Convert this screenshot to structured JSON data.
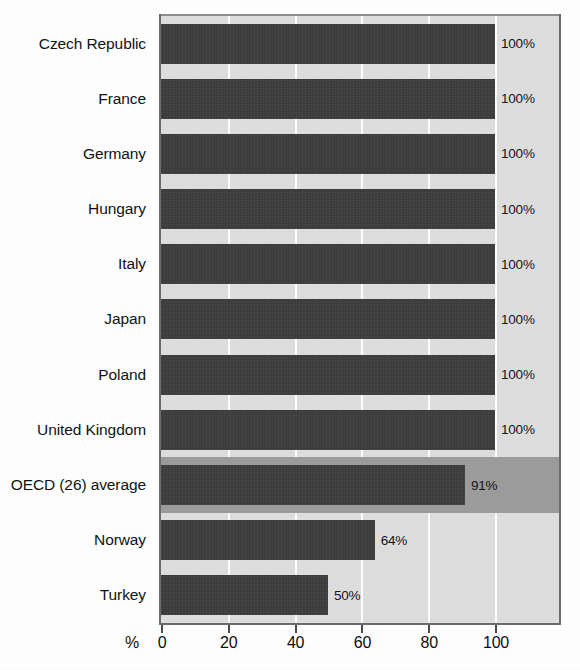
{
  "chart_data": {
    "type": "bar",
    "orientation": "horizontal",
    "title": "",
    "xlabel": "%",
    "ylabel": "",
    "categories": [
      "Czech Republic",
      "France",
      "Germany",
      "Hungary",
      "Italy",
      "Japan",
      "Poland",
      "United Kingdom",
      "OECD (26) average",
      "Norway",
      "Turkey"
    ],
    "values": [
      100,
      100,
      100,
      100,
      100,
      100,
      100,
      100,
      91,
      64,
      50
    ],
    "value_labels": [
      "100%",
      "100%",
      "100%",
      "100%",
      "100%",
      "100%",
      "100%",
      "100%",
      "91%",
      "64%",
      "50%"
    ],
    "highlighted_category": "OECD (26) average",
    "xlim": [
      0,
      120
    ],
    "xticks": [
      0,
      20,
      40,
      60,
      80,
      100
    ],
    "xtick_labels": [
      "0",
      "20",
      "40",
      "60",
      "80",
      "100"
    ],
    "grid": true,
    "legend": false,
    "legend_position": "none",
    "colors": {
      "bar": "#3a3a3a",
      "plot_background": "#dedede",
      "highlight_band": "#9c9c9c",
      "gridline": "#ffffff",
      "axis": "#4a4a4a",
      "text": "#121212",
      "page_background": "#ffffff"
    }
  },
  "axis": {
    "unit_label": "%",
    "ticks": [
      {
        "label": "0",
        "value": 0
      },
      {
        "label": "20",
        "value": 20
      },
      {
        "label": "40",
        "value": 40
      },
      {
        "label": "60",
        "value": 60
      },
      {
        "label": "80",
        "value": 80
      },
      {
        "label": "100",
        "value": 100
      }
    ]
  },
  "rows": [
    {
      "label": "Czech Republic",
      "value": 100,
      "value_label": "100%",
      "highlight": false
    },
    {
      "label": "France",
      "value": 100,
      "value_label": "100%",
      "highlight": false
    },
    {
      "label": "Germany",
      "value": 100,
      "value_label": "100%",
      "highlight": false
    },
    {
      "label": "Hungary",
      "value": 100,
      "value_label": "100%",
      "highlight": false
    },
    {
      "label": "Italy",
      "value": 100,
      "value_label": "100%",
      "highlight": false
    },
    {
      "label": "Japan",
      "value": 100,
      "value_label": "100%",
      "highlight": false
    },
    {
      "label": "Poland",
      "value": 100,
      "value_label": "100%",
      "highlight": false
    },
    {
      "label": "United Kingdom",
      "value": 100,
      "value_label": "100%",
      "highlight": false
    },
    {
      "label": "OECD (26) average",
      "value": 91,
      "value_label": "91%",
      "highlight": true
    },
    {
      "label": "Norway",
      "value": 64,
      "value_label": "64%",
      "highlight": false
    },
    {
      "label": "Turkey",
      "value": 50,
      "value_label": "50%",
      "highlight": false
    }
  ],
  "title_sliver": ""
}
